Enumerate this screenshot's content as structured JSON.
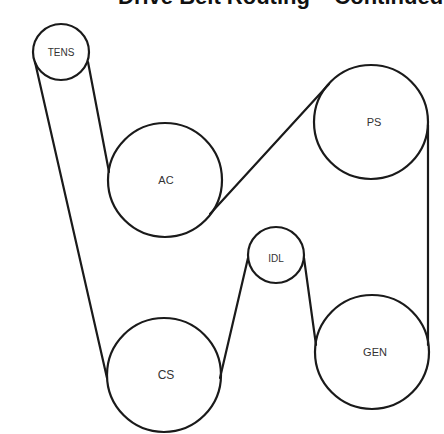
{
  "header": {
    "title": "Drive Belt Routing – Continued"
  },
  "diagram": {
    "type": "serpentine-belt-routing",
    "stroke_color": "#1a1a1a",
    "label_color": "#333333",
    "pulleys": [
      {
        "id": "tens",
        "label": "TENS",
        "cx": 61,
        "cy": 52,
        "r": 28
      },
      {
        "id": "ps",
        "label": "PS",
        "cx": 371,
        "cy": 122,
        "r": 57
      },
      {
        "id": "ac",
        "label": "AC",
        "cx": 165,
        "cy": 180,
        "r": 57
      },
      {
        "id": "idl",
        "label": "IDL",
        "cx": 276,
        "cy": 255,
        "r": 28
      },
      {
        "id": "gen",
        "label": "GEN",
        "cx": 372,
        "cy": 352,
        "r": 57
      },
      {
        "id": "cs",
        "label": "CS",
        "cx": 164,
        "cy": 375,
        "r": 57
      }
    ]
  }
}
